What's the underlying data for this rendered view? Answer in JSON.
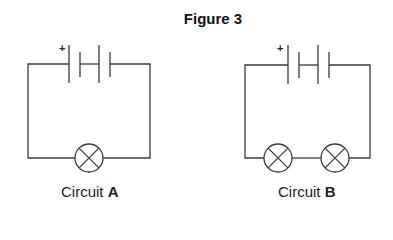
{
  "figure": {
    "title": "Figure 3"
  },
  "circuits": [
    {
      "id": "A",
      "label_prefix": "Circuit ",
      "label_letter": "A",
      "battery": {
        "cells": 2,
        "positive_marker": "+"
      },
      "lamps": 1,
      "lamp_symbol": "circle-with-cross"
    },
    {
      "id": "B",
      "label_prefix": "Circuit ",
      "label_letter": "B",
      "battery": {
        "cells": 2,
        "positive_marker": "+"
      },
      "lamps": 2,
      "lamp_symbol": "circle-with-cross"
    }
  ],
  "colors": {
    "line": "#3a3a3a",
    "text": "#222222",
    "background": "#ffffff"
  }
}
